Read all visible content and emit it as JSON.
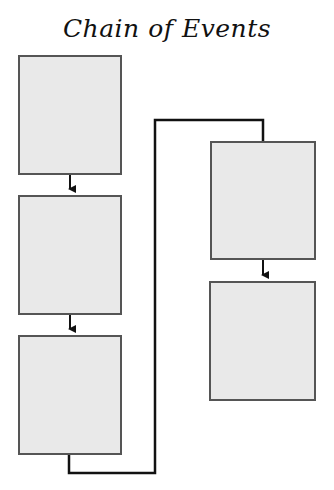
{
  "title": "Chain of Events",
  "boxes": [
    {
      "id": 1,
      "text": ""
    },
    {
      "id": 2,
      "text": ""
    },
    {
      "id": 3,
      "text": ""
    },
    {
      "id": 4,
      "text": ""
    },
    {
      "id": 5,
      "text": ""
    }
  ],
  "colors": {
    "box_fill": "#e9e9e9",
    "box_border": "#555555",
    "line": "#111111"
  }
}
